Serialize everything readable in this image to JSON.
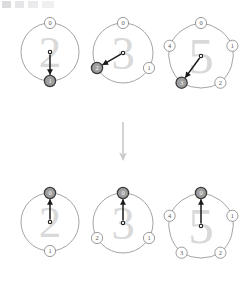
{
  "canvas": {
    "width": 247,
    "height": 305,
    "background": "#ffffff"
  },
  "colors": {
    "circle_stroke": "#9a9a9a",
    "node_stroke": "#8a8a8a",
    "node_fill": "#ffffff",
    "node_text": "#555555",
    "highlight_fill": "#9e9e9e",
    "highlight_stroke": "#3a3a3a",
    "highlight_text": "#ffffff",
    "arrow": "#1a1a1a",
    "watermark": "#d9d9d9",
    "transition_arrow": "#c9c9c9"
  },
  "transition": {
    "icon": "down-arrow",
    "label": "↓"
  },
  "rows": [
    {
      "name": "before",
      "figures": [
        {
          "id": "cycle-2-before",
          "watermark": "2",
          "node_count": 2,
          "nodes": [
            {
              "label": "0",
              "highlighted": false
            },
            {
              "label": "1",
              "highlighted": true
            }
          ],
          "pointer_target": "1",
          "pointer_angle_deg": 90
        },
        {
          "id": "cycle-3-before",
          "watermark": "3",
          "node_count": 3,
          "nodes": [
            {
              "label": "0",
              "highlighted": false
            },
            {
              "label": "1",
              "highlighted": false
            },
            {
              "label": "2",
              "highlighted": true
            }
          ],
          "pointer_target": "2",
          "pointer_angle_deg": 210
        },
        {
          "id": "cycle-5-before",
          "watermark": "5",
          "node_count": 5,
          "nodes": [
            {
              "label": "0",
              "highlighted": false
            },
            {
              "label": "1",
              "highlighted": false
            },
            {
              "label": "2",
              "highlighted": false
            },
            {
              "label": "3",
              "highlighted": true
            },
            {
              "label": "4",
              "highlighted": false
            }
          ],
          "pointer_target": "3",
          "pointer_angle_deg": 216
        }
      ]
    },
    {
      "name": "after",
      "figures": [
        {
          "id": "cycle-2-after",
          "watermark": "2",
          "node_count": 2,
          "nodes": [
            {
              "label": "0",
              "highlighted": true
            },
            {
              "label": "1",
              "highlighted": false
            }
          ],
          "pointer_target": "0",
          "pointer_angle_deg": 270
        },
        {
          "id": "cycle-3-after",
          "watermark": "3",
          "node_count": 3,
          "nodes": [
            {
              "label": "0",
              "highlighted": true
            },
            {
              "label": "1",
              "highlighted": false
            },
            {
              "label": "2",
              "highlighted": false
            }
          ],
          "pointer_target": "0",
          "pointer_angle_deg": 270
        },
        {
          "id": "cycle-5-after",
          "watermark": "5",
          "node_count": 5,
          "nodes": [
            {
              "label": "0",
              "highlighted": true
            },
            {
              "label": "1",
              "highlighted": false
            },
            {
              "label": "2",
              "highlighted": false
            },
            {
              "label": "3",
              "highlighted": false
            },
            {
              "label": "4",
              "highlighted": false
            }
          ],
          "pointer_target": "0",
          "pointer_angle_deg": 270
        }
      ]
    }
  ]
}
